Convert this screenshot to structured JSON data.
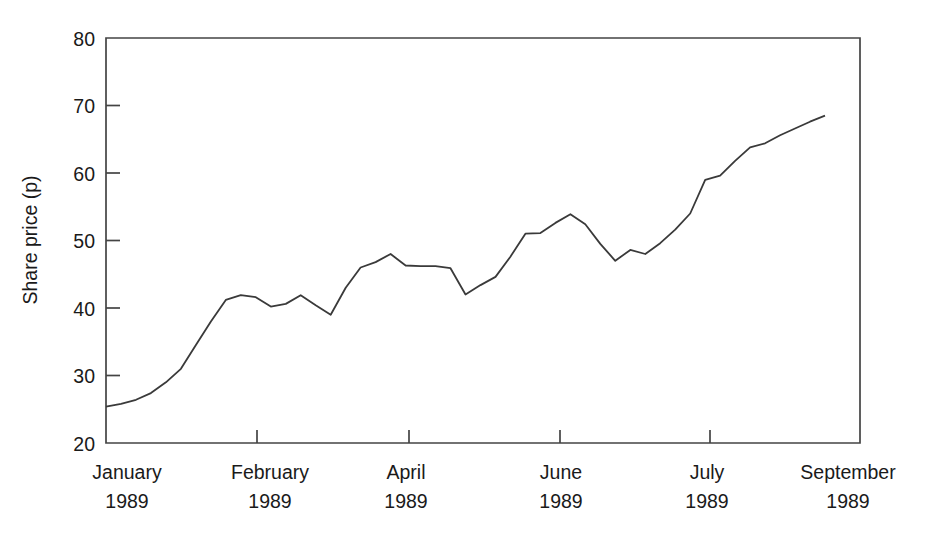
{
  "chart_data": {
    "type": "line",
    "title": "",
    "subtitle": "",
    "xlabel": "",
    "ylabel": "Share price (p)",
    "ylim": [
      20,
      80
    ],
    "yticks": [
      20,
      30,
      40,
      50,
      60,
      70,
      80
    ],
    "ytick_labels": [
      "20",
      "30",
      "40",
      "50",
      "60",
      "70",
      "80"
    ],
    "grid": false,
    "legend": "none",
    "frame": "box",
    "xtick_labels": [
      {
        "month": "January",
        "year": "1989"
      },
      {
        "month": "February",
        "year": "1989"
      },
      {
        "month": "April",
        "year": "1989"
      },
      {
        "month": "June",
        "year": "1989"
      },
      {
        "month": "July",
        "year": "1989"
      },
      {
        "month": "September",
        "year": "1989"
      }
    ],
    "xtick_positions_px": [
      106,
      257,
      409,
      560,
      710,
      860
    ],
    "series": [
      {
        "name": "Share price",
        "color": "#3a3a3a",
        "x": [
          0,
          2,
          4,
          6,
          8,
          10,
          12,
          14,
          16,
          18,
          20,
          22,
          24,
          26,
          28,
          30,
          32,
          34,
          36,
          38,
          40,
          42,
          44,
          46,
          48,
          50,
          52,
          54,
          56,
          58,
          60,
          62,
          64,
          66,
          68,
          70,
          72,
          74,
          76
        ],
        "values": [
          25.4,
          25.8,
          26.4,
          27.4,
          29.0,
          31.0,
          34.5,
          38.0,
          41.2,
          41.9,
          41.6,
          40.2,
          40.6,
          41.9,
          40.4,
          39.0,
          43.0,
          46.0,
          46.8,
          48.0,
          46.3,
          46.2,
          46.2,
          45.9,
          42.0,
          43.4,
          44.6,
          47.6,
          51.0,
          51.1,
          52.6,
          53.9,
          52.4,
          49.5,
          47.0,
          48.6,
          48.0,
          49.6,
          51.6
        ]
      },
      {
        "name": "Share price continued",
        "color": "#3a3a3a",
        "x": [
          78,
          80,
          82,
          84,
          86,
          88,
          90,
          92,
          94,
          96
        ],
        "values": [
          54.0,
          59.0,
          59.6,
          61.8,
          63.8,
          64.4,
          65.6,
          66.6,
          67.6,
          68.5
        ]
      }
    ],
    "annotations": []
  }
}
